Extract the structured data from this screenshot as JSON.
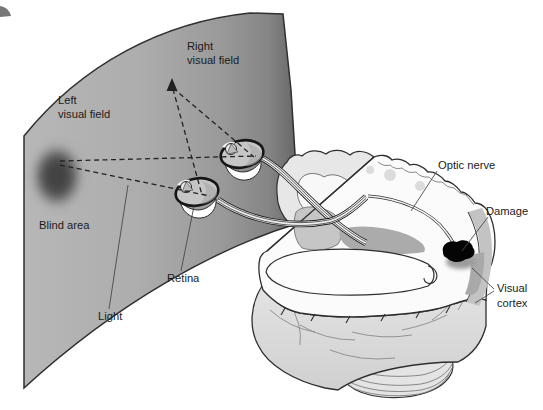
{
  "diagram": {
    "labels": {
      "left_visual_field": {
        "line1": "Left",
        "line2": "visual field"
      },
      "right_visual_field": {
        "line1": "Right",
        "line2": "visual field"
      },
      "blind_area": "Blind area",
      "light": "Light",
      "retina": "Retina",
      "optic_nerve": "Optic nerve",
      "damage": "Damage",
      "visual_cortex": {
        "line1": "Visual",
        "line2": "cortex"
      }
    },
    "colors": {
      "background": "#ffffff",
      "panel_light": "#b7b7b7",
      "panel_dark": "#676767",
      "blind_area": "#3d3d3d",
      "brain_surface": "#dcdcdc",
      "slice_surface": "#fbfbfb",
      "gray_matter": "#c6c6c6",
      "damage": "#050505",
      "outline": "#2e2e2e",
      "dashed_ray": "#222222",
      "label_text": "#1b1b1b"
    }
  }
}
